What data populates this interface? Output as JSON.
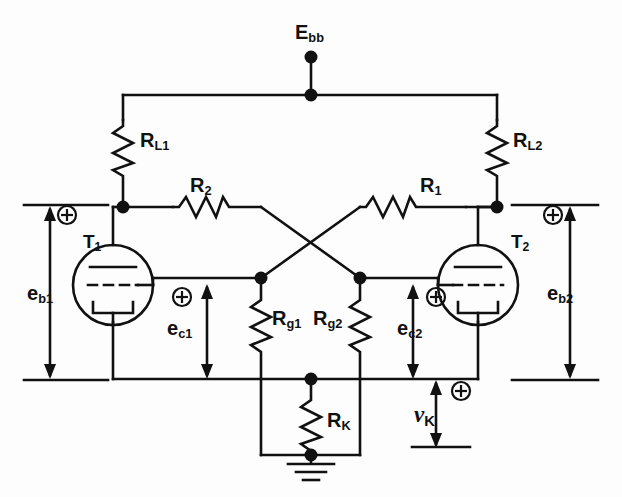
{
  "diagram": {
    "type": "vacuum-tube-schematic",
    "line_color": "#111111",
    "background_color": "#fdfdfd"
  },
  "labels": {
    "supply": {
      "base": "E",
      "sub": "bb"
    },
    "load_left": {
      "base": "R",
      "sub": "L1"
    },
    "load_right": {
      "base": "R",
      "sub": "L2"
    },
    "coupling_left": {
      "base": "R",
      "sub": "2"
    },
    "coupling_right": {
      "base": "R",
      "sub": "1"
    },
    "tube_left": {
      "base": "T",
      "sub": "1"
    },
    "tube_right": {
      "base": "T",
      "sub": "2"
    },
    "grid_res_left": {
      "base": "R",
      "sub": "g1"
    },
    "grid_res_right": {
      "base": "R",
      "sub": "g2"
    },
    "cathode_res": {
      "base": "R",
      "sub": "K"
    },
    "plate_v_left": {
      "base": "e",
      "sub": "b1"
    },
    "plate_v_right": {
      "base": "e",
      "sub": "b2"
    },
    "grid_v_left": {
      "base": "e",
      "sub": "c1"
    },
    "grid_v_right": {
      "base": "e",
      "sub": "c2"
    },
    "cathode_v": {
      "base": "v",
      "sub": "K"
    }
  },
  "polarity_markers": [
    {
      "name": "plus-eb1",
      "x": 67,
      "y": 215
    },
    {
      "name": "plus-ec1",
      "x": 182,
      "y": 297
    },
    {
      "name": "plus-ec2",
      "x": 436,
      "y": 297
    },
    {
      "name": "plus-vk",
      "x": 458,
      "y": 390
    },
    {
      "name": "plus-eb2",
      "x": 553,
      "y": 215
    }
  ],
  "nodes": [
    {
      "name": "supply-node",
      "x": 311,
      "y": 57
    },
    {
      "name": "supply-rail-node",
      "x": 311,
      "y": 95
    },
    {
      "name": "plate-node-left",
      "x": 123,
      "y": 207
    },
    {
      "name": "plate-node-right",
      "x": 497,
      "y": 207
    },
    {
      "name": "grid-node-left",
      "x": 261,
      "y": 278
    },
    {
      "name": "grid-node-right",
      "x": 360,
      "y": 278
    },
    {
      "name": "cathode-res-top",
      "x": 311,
      "y": 379
    },
    {
      "name": "ground-node",
      "x": 311,
      "y": 455
    }
  ],
  "components": {
    "resistors": [
      {
        "name": "R-L1",
        "orientation": "vertical",
        "x": 123,
        "y1": 120,
        "y2": 176
      },
      {
        "name": "R-L2",
        "orientation": "vertical",
        "x": 497,
        "y1": 120,
        "y2": 176
      },
      {
        "name": "R-2",
        "orientation": "horizontal",
        "y": 207,
        "x1": 173,
        "x2": 233
      },
      {
        "name": "R-1",
        "orientation": "horizontal",
        "y": 207,
        "x1": 406,
        "x2": 466
      },
      {
        "name": "R-g1",
        "orientation": "vertical",
        "x": 261,
        "y1": 297,
        "y2": 362
      },
      {
        "name": "R-g2",
        "orientation": "vertical",
        "x": 360,
        "y1": 297,
        "y2": 362
      },
      {
        "name": "R-K",
        "orientation": "vertical",
        "x": 311,
        "y1": 398,
        "y2": 444
      }
    ],
    "tubes": [
      {
        "name": "triode-T1",
        "cx": 113,
        "cy": 285,
        "r": 40,
        "mirrored": false
      },
      {
        "name": "triode-T2",
        "cx": 478,
        "cy": 285,
        "r": 40,
        "mirrored": true
      }
    ],
    "ground": {
      "name": "ground-symbol",
      "x": 311,
      "y": 458
    }
  },
  "measurement_arrows": [
    {
      "name": "eb1-arrow",
      "x": 50,
      "y1": 205,
      "y2": 380
    },
    {
      "name": "eb2-arrow",
      "x": 570,
      "y1": 205,
      "y2": 380
    },
    {
      "name": "ec1-arrow",
      "x": 207,
      "y1": 285,
      "y2": 378
    },
    {
      "name": "ec2-arrow",
      "x": 413,
      "y1": 285,
      "y2": 378
    },
    {
      "name": "vk-arrow",
      "x": 436,
      "y1": 381,
      "y2": 448
    }
  ]
}
